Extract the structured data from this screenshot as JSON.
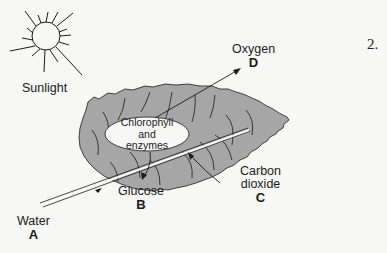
{
  "question_number": "2.",
  "labels": {
    "sunlight": "Sunlight",
    "oxygen": {
      "name": "Oxygen",
      "letter": "D"
    },
    "carbon_dioxide": {
      "line1": "Carbon",
      "line2": "dioxide",
      "letter": "C"
    },
    "glucose": {
      "name": "Glucose",
      "letter": "B"
    },
    "water": {
      "name": "Water",
      "letter": "A"
    },
    "center": {
      "line1": "Chlorophyll",
      "line2": "and",
      "line3": "enzymes"
    }
  },
  "colors": {
    "leaf_fill": "#a6a6a6",
    "line": "#1a1a1a",
    "background": "#f7f7f6",
    "ellipse_fill": "#f7f7f6"
  }
}
